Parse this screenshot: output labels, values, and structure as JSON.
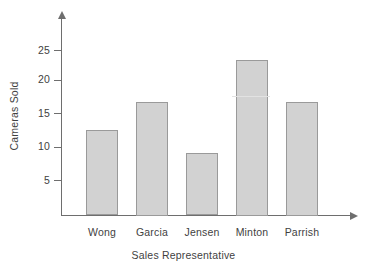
{
  "chart_data": {
    "type": "bar",
    "title": "",
    "xlabel": "Sales Representative",
    "ylabel": "Cameras Sold",
    "categories": [
      "Wong",
      "Garcia",
      "Jensen",
      "Minton",
      "Parrish"
    ],
    "values": [
      12.7,
      17.0,
      9.2,
      23.5,
      17.0
    ],
    "yticks": [
      5,
      10,
      15,
      20,
      25
    ],
    "ytick_labels": [
      "5",
      "10",
      "15",
      "20",
      "25"
    ],
    "ylim": [
      0,
      28
    ],
    "grid": false,
    "legend": null,
    "bar_fill_color": "#d2d2d2",
    "bar_border_color": "#9a9a9a",
    "axis_color": "#6e6e6e",
    "text_color": "#3f3f3f",
    "background_color": "#ffffff"
  }
}
